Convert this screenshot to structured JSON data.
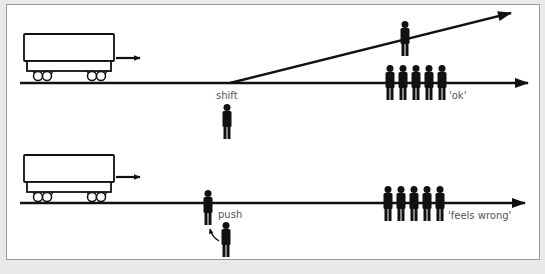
{
  "diagram": {
    "type": "trolley-problem-comparison",
    "colors": {
      "background": "#e9e9e9",
      "panel": "#ffffff",
      "ink": "#111111",
      "label": "#555555"
    },
    "scenarios": [
      {
        "id": "switch",
        "label_action": "shift",
        "label_verdict": "'ok'",
        "track_people_count": 5,
        "side_track_people_count": 1,
        "agent_icon": "person-icon"
      },
      {
        "id": "footbridge",
        "label_action": "push",
        "label_verdict": "'feels wrong'",
        "track_people_count": 5,
        "pushed_people_count": 1,
        "agent_icon": "person-icon"
      }
    ]
  }
}
